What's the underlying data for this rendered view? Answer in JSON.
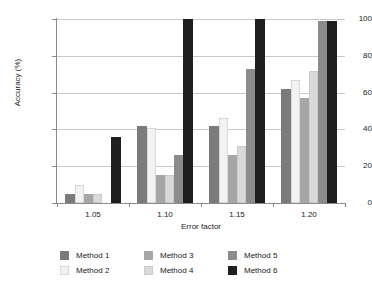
{
  "chart_data": {
    "type": "bar",
    "title": "",
    "xlabel": "Error factor",
    "ylabel": "Accuracy (%)",
    "categories": [
      "1.05",
      "1.10",
      "1.15",
      "1.20"
    ],
    "ylim": [
      0,
      100
    ],
    "yticks": [
      0,
      20,
      40,
      60,
      80,
      100
    ],
    "grid": true,
    "legend_position": "bottom",
    "series": [
      {
        "name": "Method 1",
        "color": "#7b7b7b",
        "values": [
          5,
          42,
          42,
          62
        ]
      },
      {
        "name": "Method 2",
        "color": "#f2f2f2",
        "values": [
          10,
          41,
          46,
          67
        ]
      },
      {
        "name": "Method 3",
        "color": "#a6a6a6",
        "values": [
          5,
          15,
          26,
          57
        ]
      },
      {
        "name": "Method 4",
        "color": "#d9d9d9",
        "values": [
          5,
          15,
          31,
          72
        ]
      },
      {
        "name": "Method 5",
        "color": "#8c8c8c",
        "values": [
          0,
          26,
          73,
          99
        ]
      },
      {
        "name": "Method 6",
        "color": "#1f1f1f",
        "values": [
          36,
          100,
          100,
          99
        ]
      }
    ]
  },
  "axis": {
    "ytick_labels": [
      "100",
      "80",
      "60",
      "40",
      "20",
      "0"
    ],
    "xtick_labels": [
      "1.05",
      "1.10",
      "1.15",
      "1.20"
    ]
  },
  "legend": {
    "columns": [
      [
        "Method 1",
        "Method 2"
      ],
      [
        "Method 3",
        "Method 4"
      ],
      [
        "Method 5",
        "Method 6"
      ]
    ]
  }
}
